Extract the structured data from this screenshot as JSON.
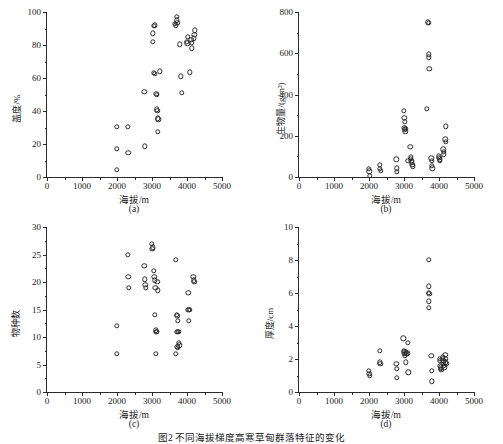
{
  "figure": {
    "caption": "图2  不同海拔梯度高寒草甸群落特征的变化",
    "x_axis_title": "海拔/m",
    "x_ticks": [
      "0",
      "1000",
      "2000",
      "3000",
      "4000",
      "5000"
    ]
  },
  "chart_data": [
    {
      "type": "scatter",
      "panel": "(a)",
      "title": "",
      "xlabel": "海拔/m",
      "ylabel": "盖度/%",
      "xlim": [
        0,
        5000
      ],
      "ylim": [
        0,
        100
      ],
      "xticks": [
        0,
        1000,
        2000,
        3000,
        4000,
        5000
      ],
      "yticks": [
        0,
        20,
        40,
        60,
        80,
        100
      ],
      "grid": false,
      "legend": "none",
      "marker": "open-circle",
      "points": [
        [
          2000,
          30.5
        ],
        [
          2000,
          17
        ],
        [
          2000,
          4.5
        ],
        [
          2300,
          30.5
        ],
        [
          2320,
          14.5
        ],
        [
          2780,
          51.5
        ],
        [
          2800,
          18.5
        ],
        [
          3020,
          87
        ],
        [
          3030,
          82
        ],
        [
          3060,
          91.5
        ],
        [
          3080,
          92
        ],
        [
          3060,
          63
        ],
        [
          3080,
          62.5
        ],
        [
          3120,
          50.5
        ],
        [
          3130,
          50
        ],
        [
          3140,
          41
        ],
        [
          3150,
          40
        ],
        [
          3160,
          35.5
        ],
        [
          3180,
          35
        ],
        [
          3170,
          27.5
        ],
        [
          3220,
          64
        ],
        [
          3660,
          93
        ],
        [
          3680,
          92
        ],
        [
          3700,
          97
        ],
        [
          3710,
          95
        ],
        [
          3720,
          93.5
        ],
        [
          3800,
          80.5
        ],
        [
          3820,
          61
        ],
        [
          3860,
          51
        ],
        [
          4000,
          82
        ],
        [
          4010,
          81
        ],
        [
          4020,
          85
        ],
        [
          4080,
          63.5
        ],
        [
          4120,
          83
        ],
        [
          4130,
          81.5
        ],
        [
          4140,
          78
        ],
        [
          4200,
          84
        ],
        [
          4210,
          86
        ],
        [
          4220,
          89
        ]
      ]
    },
    {
      "type": "scatter",
      "panel": "(b)",
      "title": "",
      "xlabel": "海拔/m",
      "ylabel": "生物量/(g/m²)",
      "xlim": [
        0,
        5000
      ],
      "ylim": [
        0,
        800
      ],
      "xticks": [
        0,
        1000,
        2000,
        3000,
        4000,
        5000
      ],
      "yticks": [
        0,
        200,
        400,
        600,
        800
      ],
      "grid": false,
      "legend": "none",
      "marker": "open-circle",
      "points": [
        [
          2000,
          40
        ],
        [
          2010,
          28
        ],
        [
          2020,
          5
        ],
        [
          2300,
          58
        ],
        [
          2310,
          40
        ],
        [
          2330,
          30
        ],
        [
          2780,
          85
        ],
        [
          2790,
          42
        ],
        [
          2800,
          25
        ],
        [
          3000,
          322
        ],
        [
          3010,
          288
        ],
        [
          3020,
          268
        ],
        [
          3010,
          240
        ],
        [
          3030,
          232
        ],
        [
          3040,
          222
        ],
        [
          3050,
          235
        ],
        [
          3180,
          145
        ],
        [
          3190,
          95
        ],
        [
          3200,
          88
        ],
        [
          3210,
          80
        ],
        [
          3230,
          72
        ],
        [
          3240,
          60
        ],
        [
          3250,
          52
        ],
        [
          3120,
          78
        ],
        [
          3680,
          750
        ],
        [
          3700,
          748
        ],
        [
          3700,
          595
        ],
        [
          3710,
          580
        ],
        [
          3720,
          525
        ],
        [
          3660,
          330
        ],
        [
          3780,
          90
        ],
        [
          3790,
          78
        ],
        [
          3800,
          55
        ],
        [
          3810,
          42
        ],
        [
          4000,
          100
        ],
        [
          4010,
          92
        ],
        [
          4020,
          85
        ],
        [
          4030,
          78
        ],
        [
          4120,
          135
        ],
        [
          4130,
          122
        ],
        [
          4140,
          110
        ],
        [
          4180,
          182
        ],
        [
          4190,
          172
        ],
        [
          4200,
          245
        ]
      ]
    },
    {
      "type": "scatter",
      "panel": "(c)",
      "title": "",
      "xlabel": "海拔/m",
      "ylabel": "物种数",
      "xlim": [
        0,
        5000
      ],
      "ylim": [
        0,
        30
      ],
      "xticks": [
        0,
        1000,
        2000,
        3000,
        4000,
        5000
      ],
      "yticks": [
        0,
        5,
        10,
        15,
        20,
        25,
        30
      ],
      "grid": false,
      "legend": "none",
      "marker": "open-circle",
      "points": [
        [
          2000,
          12
        ],
        [
          2000,
          7
        ],
        [
          2300,
          25
        ],
        [
          2320,
          21
        ],
        [
          2330,
          19
        ],
        [
          2780,
          23
        ],
        [
          2800,
          20.5
        ],
        [
          2810,
          19.5
        ],
        [
          2820,
          19
        ],
        [
          3000,
          27
        ],
        [
          3010,
          26
        ],
        [
          3020,
          26.3
        ],
        [
          3060,
          22
        ],
        [
          3070,
          21
        ],
        [
          3080,
          20.3
        ],
        [
          3090,
          19
        ],
        [
          3150,
          20
        ],
        [
          3160,
          18.5
        ],
        [
          3080,
          14
        ],
        [
          3100,
          11.2
        ],
        [
          3120,
          11
        ],
        [
          3140,
          11
        ],
        [
          3100,
          7
        ],
        [
          3680,
          24
        ],
        [
          3700,
          14
        ],
        [
          3720,
          13.8
        ],
        [
          3740,
          13
        ],
        [
          3700,
          11
        ],
        [
          3730,
          11
        ],
        [
          3760,
          11
        ],
        [
          3720,
          8.2
        ],
        [
          3740,
          8
        ],
        [
          3680,
          7
        ],
        [
          3760,
          9
        ],
        [
          3780,
          8.5
        ],
        [
          4040,
          18
        ],
        [
          4040,
          15
        ],
        [
          4060,
          15
        ],
        [
          4080,
          15
        ],
        [
          4060,
          13
        ],
        [
          4180,
          21
        ],
        [
          4200,
          20.3
        ],
        [
          4210,
          20
        ]
      ]
    },
    {
      "type": "scatter",
      "panel": "(d)",
      "title": "",
      "xlabel": "海拔/m",
      "ylabel": "厚度/cm",
      "xlim": [
        0,
        5000
      ],
      "ylim": [
        0,
        10
      ],
      "xticks": [
        0,
        1000,
        2000,
        3000,
        4000,
        5000
      ],
      "yticks": [
        0,
        2,
        4,
        6,
        8,
        10
      ],
      "grid": false,
      "legend": "none",
      "marker": "open-circle",
      "points": [
        [
          2000,
          1.3
        ],
        [
          2010,
          1.1
        ],
        [
          2020,
          1.0
        ],
        [
          2300,
          2.5
        ],
        [
          2310,
          1.8
        ],
        [
          2320,
          1.7
        ],
        [
          2780,
          1.7
        ],
        [
          2790,
          1.4
        ],
        [
          2800,
          0.85
        ],
        [
          2980,
          3.25
        ],
        [
          3000,
          2.5
        ],
        [
          3010,
          2.4
        ],
        [
          3020,
          2.3
        ],
        [
          3030,
          2.2
        ],
        [
          3060,
          2.4
        ],
        [
          3080,
          2.3
        ],
        [
          3090,
          2.35
        ],
        [
          3100,
          3.0
        ],
        [
          3060,
          1.8
        ],
        [
          3120,
          1.2
        ],
        [
          3700,
          8.0
        ],
        [
          3700,
          6.4
        ],
        [
          3710,
          6.0
        ],
        [
          3720,
          5.95
        ],
        [
          3700,
          5.5
        ],
        [
          3710,
          5.1
        ],
        [
          3780,
          2.2
        ],
        [
          3790,
          1.3
        ],
        [
          3800,
          0.65
        ],
        [
          4020,
          2.0
        ],
        [
          4030,
          1.9
        ],
        [
          4040,
          1.6
        ],
        [
          4050,
          1.5
        ],
        [
          4060,
          1.4
        ],
        [
          4070,
          1.35
        ],
        [
          4100,
          2.1
        ],
        [
          4110,
          2.0
        ],
        [
          4120,
          1.9
        ],
        [
          4130,
          1.7
        ],
        [
          4140,
          1.6
        ],
        [
          4150,
          1.5
        ],
        [
          4180,
          2.25
        ],
        [
          4190,
          2.0
        ],
        [
          4200,
          1.8
        ],
        [
          4210,
          1.7
        ]
      ]
    }
  ]
}
